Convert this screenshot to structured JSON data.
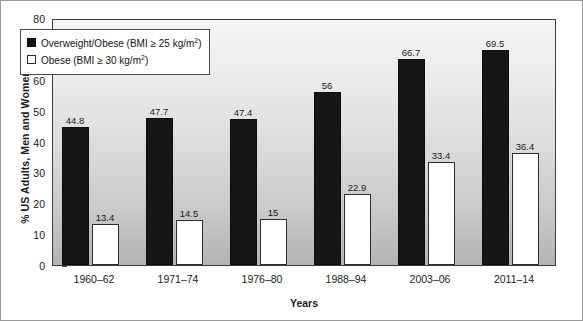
{
  "chart_data": {
    "type": "bar",
    "title": "",
    "xlabel": "Years",
    "ylabel": "% US Adults, Men and Women",
    "ylim": [
      0,
      80
    ],
    "yticks": [
      0,
      10,
      20,
      30,
      40,
      50,
      60,
      70,
      80
    ],
    "ytick_labels": [
      "0",
      "10",
      "20",
      "30",
      "40",
      "50",
      "60",
      "70",
      "80"
    ],
    "grid": false,
    "legend_position": "upper-left-inside",
    "categories": [
      "1960–62",
      "1971–74",
      "1976–80",
      "1988–94",
      "2003–06",
      "2011–14"
    ],
    "series": [
      {
        "name": "Overweight/Obese (BMI ≥ 25 kg/m2)",
        "legend_prefix": "Overweight/Obese (BMI ≥ 25 kg/m",
        "legend_sup": "2",
        "legend_suffix": ")",
        "color": "#161616",
        "swatch": "dark",
        "values": [
          44.8,
          47.7,
          47.4,
          56,
          66.7,
          69.5
        ],
        "value_labels": [
          "44.8",
          "47.7",
          "47.4",
          "56",
          "66.7",
          "69.5"
        ]
      },
      {
        "name": "Obese (BMI ≥ 30 kg/m2)",
        "legend_prefix": "Obese (BMI ≥ 30 kg/m",
        "legend_sup": "2",
        "legend_suffix": ")",
        "color": "#ffffff",
        "swatch": "light",
        "values": [
          13.4,
          14.5,
          15,
          22.9,
          33.4,
          36.4
        ],
        "value_labels": [
          "13.4",
          "14.5",
          "15",
          "22.9",
          "33.4",
          "36.4"
        ]
      }
    ]
  }
}
